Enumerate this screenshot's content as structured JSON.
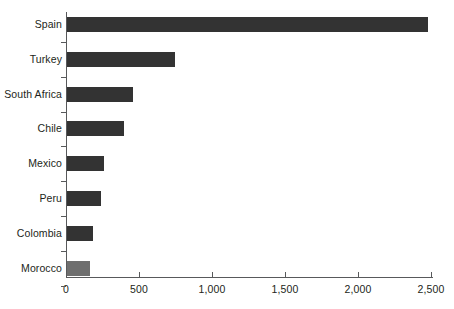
{
  "chart_data": {
    "type": "bar",
    "orientation": "horizontal",
    "title": "",
    "subtitle": "",
    "xlabel": "",
    "ylabel": "",
    "categories": [
      "Spain",
      "Turkey",
      "South Africa",
      "Chile",
      "Mexico",
      "Peru",
      "Colombia",
      "Morocco"
    ],
    "values": [
      2470,
      740,
      450,
      390,
      255,
      235,
      180,
      155
    ],
    "bar_colors": [
      "#333333",
      "#333333",
      "#333333",
      "#333333",
      "#333333",
      "#333333",
      "#333333",
      "#6e6e6e"
    ],
    "xlim": [
      0,
      2500
    ],
    "xticks": [
      0,
      500,
      1000,
      1500,
      2000,
      2500
    ],
    "xtick_labels": [
      "0",
      "500",
      "1,000",
      "1,500",
      "2,000",
      "2,500"
    ],
    "grid": false,
    "legend": null,
    "annotations": []
  },
  "colors": {
    "bar_primary": "#333333",
    "bar_highlight": "#6e6e6e",
    "axis": "#58595b",
    "text": "#231f20",
    "background": "#ffffff"
  }
}
